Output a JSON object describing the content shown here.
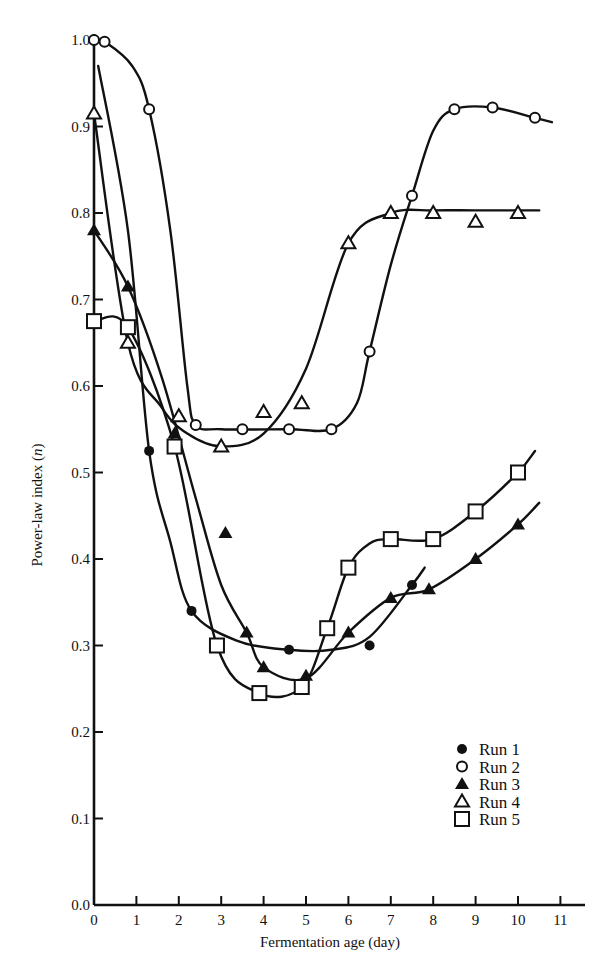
{
  "chart_data": {
    "type": "line",
    "title": "",
    "xlabel": "Fermentation age (day)",
    "ylabel": "Power-law index (n)",
    "xlim": [
      0,
      11.5
    ],
    "ylim": [
      0.0,
      1.0
    ],
    "x_ticks": [
      "0",
      "1",
      "2",
      "3",
      "4",
      "5",
      "6",
      "7",
      "8",
      "9",
      "10",
      "11"
    ],
    "y_ticks": [
      "0.0",
      "0.1",
      "0.2",
      "0.3",
      "0.4",
      "0.5",
      "0.6",
      "0.7",
      "0.8",
      "0.9",
      "1.0"
    ],
    "grid": false,
    "legend_position": "lower right",
    "series": [
      {
        "name": "Run 1",
        "marker": "filled-circle",
        "x": [
          1.3,
          2.3,
          4.6,
          6.5,
          7.5
        ],
        "y": [
          0.525,
          0.34,
          0.295,
          0.3,
          0.37
        ]
      },
      {
        "name": "Run 2",
        "marker": "open-circle",
        "x": [
          0.0,
          0.25,
          1.3,
          2.4,
          3.5,
          4.6,
          5.6,
          6.5,
          7.5,
          8.5,
          9.4,
          10.4
        ],
        "y": [
          1.0,
          0.998,
          0.92,
          0.555,
          0.55,
          0.55,
          0.55,
          0.64,
          0.82,
          0.92,
          0.922,
          0.91
        ]
      },
      {
        "name": "Run 3",
        "marker": "filled-triangle",
        "x": [
          0.0,
          0.8,
          1.9,
          3.1,
          3.6,
          4.0,
          5.0,
          6.0,
          7.0,
          7.9,
          9.0,
          10.0
        ],
        "y": [
          0.78,
          0.715,
          0.545,
          0.43,
          0.315,
          0.275,
          0.265,
          0.315,
          0.355,
          0.365,
          0.4,
          0.44
        ]
      },
      {
        "name": "Run 4",
        "marker": "open-triangle",
        "x": [
          0.0,
          0.8,
          2.0,
          3.0,
          4.0,
          4.9,
          6.0,
          7.0,
          8.0,
          9.0,
          10.0
        ],
        "y": [
          0.915,
          0.65,
          0.565,
          0.53,
          0.57,
          0.58,
          0.765,
          0.8,
          0.8,
          0.79,
          0.8
        ]
      },
      {
        "name": "Run 5",
        "marker": "open-square",
        "x": [
          0.0,
          0.8,
          1.9,
          2.9,
          3.9,
          4.9,
          5.5,
          6.0,
          7.0,
          8.0,
          9.0,
          10.0
        ],
        "y": [
          0.675,
          0.668,
          0.53,
          0.3,
          0.245,
          0.252,
          0.32,
          0.39,
          0.423,
          0.423,
          0.455,
          0.5
        ]
      }
    ]
  },
  "axes": {
    "xlabel": "Fermentation age (day)",
    "ylabel": "Power-law index (n)"
  },
  "legend": {
    "items": [
      {
        "marker": "filled-circle",
        "label": "Run",
        "num": "1"
      },
      {
        "marker": "open-circle",
        "label": "Run",
        "num": "2"
      },
      {
        "marker": "filled-triangle",
        "label": "Run",
        "num": "3"
      },
      {
        "marker": "open-triangle",
        "label": "Run",
        "num": "4"
      },
      {
        "marker": "open-square",
        "label": "Run",
        "num": "5"
      }
    ]
  },
  "colors": {
    "ink": "#111111",
    "background": "#ffffff"
  }
}
